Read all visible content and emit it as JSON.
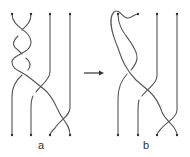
{
  "diagram": {
    "panels": [
      {
        "label": "a",
        "strand_count": 4
      },
      {
        "label": "b",
        "strand_count": 4
      }
    ],
    "arrow": "right-arrow",
    "stroke_color": "#555555"
  }
}
